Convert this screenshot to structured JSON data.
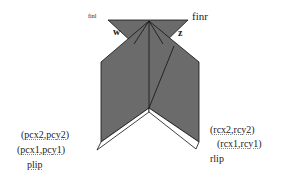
{
  "diagram": {
    "title": "",
    "colors": {
      "fill": "#6b6b6b",
      "stroke": "#111111",
      "background": "#ffffff",
      "strip": "#ffffff"
    },
    "labels": {
      "finl": "finl",
      "finr": "finr",
      "w": "w",
      "z": "z",
      "left_point2": "(pcx2,pcy2)",
      "left_point1": "(pcx1,pcy1)",
      "left_lip": "plip",
      "right_point2": "(rcx2,rcy2)",
      "right_point1": "(rcx1,rcy1)",
      "right_lip": "rlip"
    },
    "shapes": [
      {
        "name": "top-left-fin",
        "type": "triangle"
      },
      {
        "name": "top-right-fin",
        "type": "triangle"
      },
      {
        "name": "body",
        "type": "polygon"
      },
      {
        "name": "left-lip-strip",
        "type": "strip"
      },
      {
        "name": "right-lip-strip",
        "type": "strip"
      }
    ]
  }
}
